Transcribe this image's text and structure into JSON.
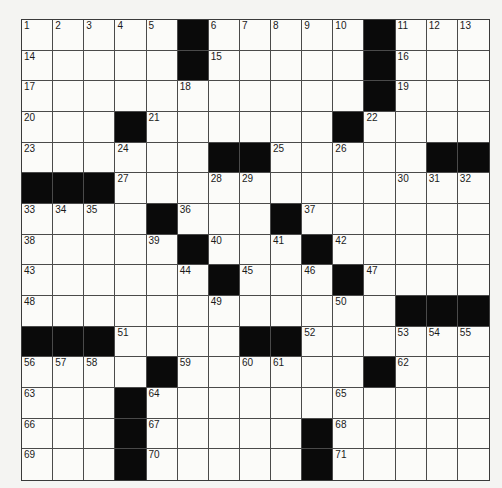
{
  "puzzle": {
    "rows": 15,
    "cols": 15,
    "grid": [
      ".....#.....#...",
      ".....#.....#...",
      "...........#...",
      "...#......#....",
      "......##.....##",
      "###............",
      "....#...#......",
      ".....#...#.....",
      "......#...#....",
      "............###",
      "###....##......",
      "....#......#...",
      "...#...........",
      "...#.....#.....",
      "...#.....#....."
    ],
    "numbers": [
      [
        1,
        2,
        3,
        4,
        5,
        0,
        6,
        7,
        8,
        9,
        10,
        0,
        11,
        12,
        13
      ],
      [
        14,
        0,
        0,
        0,
        0,
        0,
        15,
        0,
        0,
        0,
        0,
        0,
        16,
        0,
        0
      ],
      [
        17,
        0,
        0,
        0,
        0,
        18,
        0,
        0,
        0,
        0,
        0,
        0,
        19,
        0,
        0
      ],
      [
        20,
        0,
        0,
        0,
        21,
        0,
        0,
        0,
        0,
        0,
        0,
        22,
        0,
        0,
        0
      ],
      [
        23,
        0,
        0,
        24,
        0,
        0,
        0,
        0,
        25,
        0,
        26,
        0,
        0,
        0,
        0
      ],
      [
        0,
        0,
        0,
        27,
        0,
        0,
        28,
        29,
        0,
        0,
        0,
        0,
        30,
        31,
        32
      ],
      [
        33,
        34,
        35,
        0,
        0,
        36,
        0,
        0,
        0,
        37,
        0,
        0,
        0,
        0,
        0
      ],
      [
        38,
        0,
        0,
        0,
        39,
        0,
        40,
        0,
        41,
        0,
        42,
        0,
        0,
        0,
        0
      ],
      [
        43,
        0,
        0,
        0,
        0,
        44,
        0,
        45,
        0,
        46,
        0,
        47,
        0,
        0,
        0
      ],
      [
        48,
        0,
        0,
        0,
        0,
        0,
        49,
        0,
        0,
        0,
        50,
        0,
        0,
        0,
        0
      ],
      [
        0,
        0,
        0,
        51,
        0,
        0,
        0,
        0,
        0,
        52,
        0,
        0,
        53,
        54,
        55
      ],
      [
        56,
        57,
        58,
        0,
        0,
        59,
        0,
        60,
        61,
        0,
        0,
        0,
        62,
        0,
        0
      ],
      [
        63,
        0,
        0,
        0,
        64,
        0,
        0,
        0,
        0,
        0,
        65,
        0,
        0,
        0,
        0
      ],
      [
        66,
        0,
        0,
        0,
        67,
        0,
        0,
        0,
        0,
        0,
        68,
        0,
        0,
        0,
        0
      ],
      [
        69,
        0,
        0,
        0,
        70,
        0,
        0,
        0,
        0,
        0,
        71,
        0,
        0,
        0,
        0
      ]
    ]
  },
  "colors": {
    "block": "#0a0a0a",
    "cell": "#fbfbf9",
    "line": "#4a4a4a",
    "number": "#1a1a1a"
  }
}
